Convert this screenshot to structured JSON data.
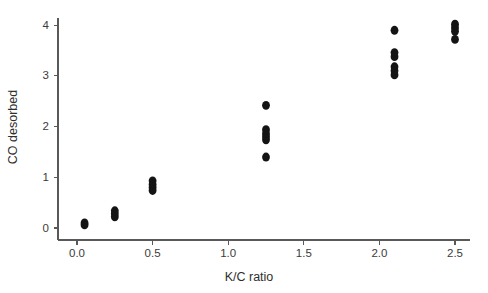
{
  "figure": {
    "width": 488,
    "height": 293,
    "background": "#ffffff",
    "point_color": "#141414",
    "axis_color": "#595959"
  },
  "chart_data": {
    "type": "scatter",
    "title": "",
    "xlabel": "K/C ratio",
    "ylabel": "CO desorbed",
    "xlim": [
      -0.08,
      2.62
    ],
    "ylim": [
      -0.18,
      4.32
    ],
    "xticks": [
      0.0,
      0.5,
      1.0,
      1.5,
      2.0,
      2.5
    ],
    "xticklabels": [
      "0.0",
      "0.5",
      "1.0",
      "1.5",
      "2.0",
      "2.5"
    ],
    "yticks": [
      0,
      1,
      2,
      3,
      4
    ],
    "yticklabels": [
      "0",
      "1",
      "2",
      "3",
      "4"
    ],
    "grid": false,
    "legend": null,
    "marker": "circle",
    "marker_size": 5.0,
    "points": [
      {
        "x": 0.05,
        "y": 0.06
      },
      {
        "x": 0.05,
        "y": 0.1
      },
      {
        "x": 0.25,
        "y": 0.22
      },
      {
        "x": 0.25,
        "y": 0.28
      },
      {
        "x": 0.25,
        "y": 0.34
      },
      {
        "x": 0.5,
        "y": 0.74
      },
      {
        "x": 0.5,
        "y": 0.8
      },
      {
        "x": 0.5,
        "y": 0.86
      },
      {
        "x": 0.5,
        "y": 0.93
      },
      {
        "x": 1.25,
        "y": 1.4
      },
      {
        "x": 1.25,
        "y": 1.74
      },
      {
        "x": 1.25,
        "y": 1.8
      },
      {
        "x": 1.25,
        "y": 1.86
      },
      {
        "x": 1.25,
        "y": 1.94
      },
      {
        "x": 1.25,
        "y": 2.42
      },
      {
        "x": 2.1,
        "y": 3.02
      },
      {
        "x": 2.1,
        "y": 3.1
      },
      {
        "x": 2.1,
        "y": 3.18
      },
      {
        "x": 2.1,
        "y": 3.38
      },
      {
        "x": 2.1,
        "y": 3.46
      },
      {
        "x": 2.1,
        "y": 3.9
      },
      {
        "x": 2.5,
        "y": 3.72
      },
      {
        "x": 2.5,
        "y": 3.88
      },
      {
        "x": 2.5,
        "y": 3.95
      },
      {
        "x": 2.5,
        "y": 4.02
      }
    ]
  }
}
